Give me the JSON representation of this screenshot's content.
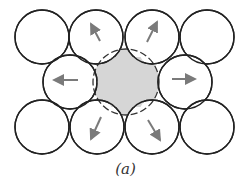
{
  "caption": "(a)",
  "colors": {
    "circle_stroke": "#222222",
    "arrow": "#7a7a7a",
    "shaded_fill": "#d6d6d6",
    "dashed_stroke": "#333333"
  },
  "circle_radius": 27,
  "circles": [
    {
      "id": "top-1",
      "cx": 42,
      "cy": 37,
      "arrow": null
    },
    {
      "id": "top-2",
      "cx": 96,
      "cy": 37,
      "arrow": {
        "x1": 100,
        "y1": 41,
        "x2": 91,
        "y2": 24
      }
    },
    {
      "id": "top-3",
      "cx": 152,
      "cy": 37,
      "arrow": {
        "x1": 147,
        "y1": 42,
        "x2": 157,
        "y2": 22
      }
    },
    {
      "id": "top-4",
      "cx": 207,
      "cy": 37,
      "arrow": null
    },
    {
      "id": "mid-1",
      "cx": 70,
      "cy": 82,
      "arrow": {
        "x1": 78,
        "y1": 80,
        "x2": 54,
        "y2": 80
      }
    },
    {
      "id": "mid-3",
      "cx": 185,
      "cy": 82,
      "arrow": {
        "x1": 172,
        "y1": 79,
        "x2": 195,
        "y2": 79
      }
    },
    {
      "id": "bot-1",
      "cx": 42,
      "cy": 127,
      "arrow": null
    },
    {
      "id": "bot-2",
      "cx": 97,
      "cy": 127,
      "arrow": {
        "x1": 101,
        "y1": 117,
        "x2": 91,
        "y2": 139
      }
    },
    {
      "id": "bot-3",
      "cx": 152,
      "cy": 127,
      "arrow": {
        "x1": 148,
        "y1": 120,
        "x2": 160,
        "y2": 140
      }
    },
    {
      "id": "bot-4",
      "cx": 207,
      "cy": 127,
      "arrow": null
    }
  ],
  "center": {
    "cx": 126,
    "cy": 82,
    "r": 33
  }
}
